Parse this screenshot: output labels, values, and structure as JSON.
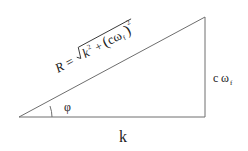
{
  "diagram": {
    "colors": {
      "line": "#6e6e6e",
      "text": "#222222",
      "background": "#ffffff"
    },
    "hypotenuse_label": {
      "lhs": "R =",
      "radicand_k": "k",
      "radicand_k_exp": "2",
      "plus": "+",
      "paren_open": "(",
      "c": "c",
      "omega": "ω",
      "omega_sub": "f",
      "paren_close": ")",
      "outer_exp": "2"
    },
    "angle_label": "φ",
    "base_label": "k",
    "vertical_label": {
      "c": "c",
      "omega": "ω",
      "omega_sub": "f"
    }
  }
}
